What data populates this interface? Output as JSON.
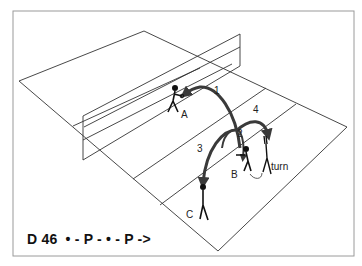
{
  "diagram": {
    "caption": "D 46  • - P - • - P ->",
    "players": [
      {
        "id": "A",
        "label": "A"
      },
      {
        "id": "B",
        "label": "B"
      },
      {
        "id": "C",
        "label": "C"
      }
    ],
    "passes": [
      {
        "order": "1",
        "from": "B",
        "to": "A"
      },
      {
        "order": "2",
        "from": "A",
        "to": "B"
      },
      {
        "order": "3",
        "from": "B",
        "to": "C"
      },
      {
        "order": "4",
        "from": "B",
        "to": "turn"
      }
    ],
    "annotation": "turn",
    "colors": {
      "line": "#333333",
      "arrow": "#3a3a3a",
      "frame": "#999999",
      "background": "#ffffff"
    }
  }
}
